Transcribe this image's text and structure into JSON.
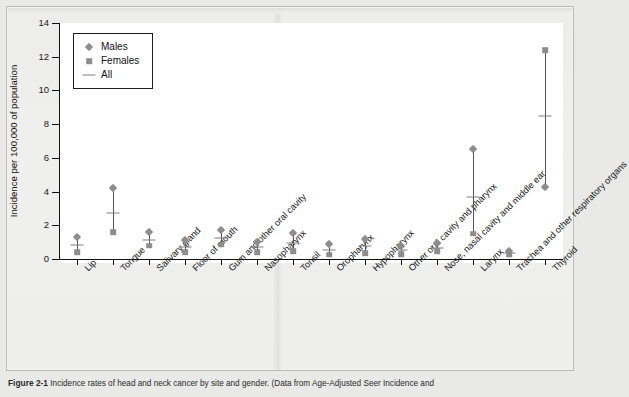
{
  "figure": {
    "caption_label": "Figure 2-1",
    "caption_text": "Incidence rates of head and neck cancer by site and gender. (Data from Age-Adjusted Seer Incidence and"
  },
  "chart_data": {
    "type": "scatter",
    "title": "",
    "xlabel": "",
    "ylabel": "Incidence per 100,000 of population",
    "ylim": [
      0,
      14
    ],
    "yticks": [
      0,
      2,
      4,
      6,
      8,
      10,
      12,
      14
    ],
    "grid": false,
    "legend_position": "top-left",
    "legend": [
      {
        "name": "Males",
        "marker": "diamond"
      },
      {
        "name": "Females",
        "marker": "square"
      },
      {
        "name": "All",
        "marker": "dash"
      }
    ],
    "categories": [
      "Lip",
      "Tongue",
      "Salivary gland",
      "Floor of mouth",
      "Gum and other oral cavity",
      "Nasopharynx",
      "Tonsil",
      "Oropharynx",
      "Hypopharynx",
      "Other oral cavity and pharynx",
      "Nose, nasal cavity and middle ear",
      "Larynx",
      "Trachea and other respiratory organs",
      "Thyroid"
    ],
    "series": [
      {
        "name": "Males",
        "values": [
          1.3,
          4.2,
          1.6,
          1.1,
          1.7,
          1.0,
          1.55,
          0.9,
          1.2,
          0.8,
          0.95,
          6.5,
          0.5,
          4.3
        ]
      },
      {
        "name": "All",
        "values": [
          0.85,
          2.7,
          1.15,
          0.7,
          1.25,
          0.7,
          0.95,
          0.55,
          0.75,
          0.55,
          0.65,
          3.7,
          0.35,
          8.5
        ]
      },
      {
        "name": "Females",
        "values": [
          0.4,
          1.6,
          0.8,
          0.4,
          0.85,
          0.4,
          0.45,
          0.25,
          0.35,
          0.3,
          0.45,
          1.5,
          0.25,
          12.4
        ]
      }
    ]
  }
}
